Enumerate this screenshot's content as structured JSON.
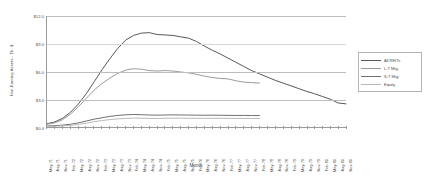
{
  "chart_data": {
    "type": "line",
    "title": "",
    "xlabel": "Month",
    "ylabel": "Non-Earning Assets - Th. $",
    "ylim": [
      0,
      12
    ],
    "yticks": [
      "$0.0",
      "$3.0",
      "$6.0",
      "$9.0",
      "$12.0"
    ],
    "ytick_values": [
      0,
      3,
      6,
      9,
      12
    ],
    "grid": true,
    "legend_position": "right",
    "x": [
      "May-71",
      "Aug-71",
      "Nov-71",
      "Feb-72",
      "May-72",
      "Aug-72",
      "Nov-72",
      "Feb-73",
      "May-73",
      "Aug-73",
      "Nov-73",
      "Feb-74",
      "May-74",
      "Aug-74",
      "Nov-74",
      "Feb-75",
      "May-75",
      "Aug-75",
      "Nov-75",
      "Feb-76",
      "May-76",
      "Aug-76",
      "Nov-76",
      "Feb-77",
      "May-77",
      "Aug-77",
      "Nov-77",
      "Feb-78",
      "May-78",
      "Aug-78",
      "Nov-78",
      "Feb-79",
      "May-79",
      "Aug-79",
      "Nov-79",
      "Feb-80",
      "May-80",
      "Aug-80",
      "Nov-80"
    ],
    "xtick_labels": [
      "May-71",
      "Aug-71",
      "Nov-71",
      "Feb-72",
      "May-72",
      "Aug-72",
      "Nov-72",
      "Feb-73",
      "May-73",
      "Aug-73",
      "Nov-73",
      "Feb-74",
      "May-74",
      "Aug-74",
      "Nov-74",
      "Feb-75",
      "May-75",
      "Aug-75",
      "Nov-75",
      "Feb-76",
      "May-76",
      "Aug-76",
      "Nov-76",
      "Feb-77",
      "May-77",
      "Aug-77",
      "Nov-77",
      "Feb-78",
      "May-78",
      "Aug-78",
      "Nov-78",
      "Feb-79",
      "May-79",
      "Aug-79",
      "Nov-79",
      "Feb-80",
      "May-80",
      "Aug-80",
      "Nov-80"
    ],
    "series": [
      {
        "name": "All REITs",
        "color": "#585858",
        "width": 1.0,
        "values": [
          0.35,
          0.55,
          0.95,
          1.6,
          2.5,
          3.6,
          4.9,
          6.2,
          7.4,
          8.5,
          9.4,
          9.9,
          10.15,
          10.2,
          10.0,
          9.95,
          9.9,
          9.75,
          9.6,
          9.25,
          8.75,
          8.3,
          7.9,
          7.45,
          7.0,
          6.55,
          6.1,
          5.75,
          5.4,
          5.05,
          4.75,
          4.45,
          4.15,
          3.85,
          3.6,
          3.3,
          3.0,
          2.6,
          2.5
        ]
      },
      {
        "name": "L-T Mtg.",
        "color": "#9b9b9b",
        "width": 1.0,
        "values": [
          0.3,
          0.45,
          0.8,
          1.4,
          2.2,
          3.1,
          4.0,
          4.7,
          5.3,
          5.8,
          6.15,
          6.3,
          6.25,
          6.1,
          6.05,
          6.1,
          6.05,
          5.95,
          5.85,
          5.7,
          5.5,
          5.35,
          5.25,
          5.2,
          5.0,
          4.85,
          4.8,
          4.75,
          null,
          null,
          null,
          null,
          null,
          null,
          null,
          null,
          null,
          null,
          null
        ]
      },
      {
        "name": "S-T Mtg.",
        "color": "#707070",
        "width": 1.0,
        "values": [
          0.1,
          0.15,
          0.2,
          0.3,
          0.45,
          0.65,
          0.85,
          1.0,
          1.15,
          1.25,
          1.32,
          1.35,
          1.33,
          1.3,
          1.28,
          1.3,
          1.31,
          1.3,
          1.29,
          1.28,
          1.27,
          1.28,
          1.27,
          1.26,
          1.25,
          1.25,
          1.24,
          1.24,
          null,
          null,
          null,
          null,
          null,
          null,
          null,
          null,
          null,
          null,
          null
        ]
      },
      {
        "name": "Equity",
        "color": "#b8b8b8",
        "width": 1.0,
        "values": [
          0.05,
          0.08,
          0.12,
          0.18,
          0.28,
          0.42,
          0.58,
          0.7,
          0.8,
          0.88,
          0.93,
          0.96,
          0.95,
          0.93,
          0.92,
          0.94,
          0.95,
          0.95,
          0.94,
          0.94,
          0.93,
          0.94,
          0.94,
          0.93,
          0.93,
          0.93,
          0.92,
          0.92,
          null,
          null,
          null,
          null,
          null,
          null,
          null,
          null,
          null,
          null,
          null
        ]
      }
    ]
  }
}
